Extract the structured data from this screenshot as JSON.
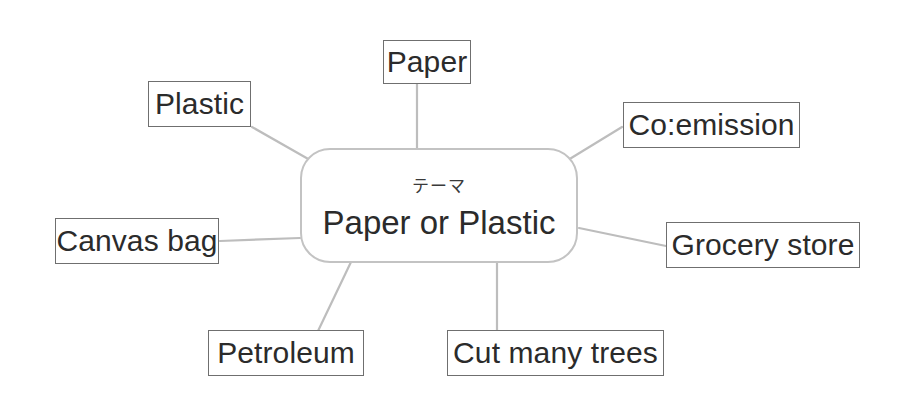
{
  "diagram": {
    "type": "mind-map",
    "background_color": "#ffffff",
    "connector_color": "#bdbdbd",
    "box_border_color": "#6f6f6f",
    "center_border_color": "#c3c3c3",
    "text_color": "#2b2b2b",
    "center": {
      "subtitle": "テーマ",
      "title": "Paper or Plastic"
    },
    "branches": [
      {
        "id": "paper",
        "label": "Paper",
        "position": "top"
      },
      {
        "id": "plastic",
        "label": "Plastic",
        "position": "top-left"
      },
      {
        "id": "co-emission",
        "label": "Co:emission",
        "position": "top-right"
      },
      {
        "id": "canvas-bag",
        "label": "Canvas bag",
        "position": "left"
      },
      {
        "id": "grocery-store",
        "label": "Grocery store",
        "position": "right"
      },
      {
        "id": "petroleum",
        "label": "Petroleum",
        "position": "bottom-left"
      },
      {
        "id": "cut-many-trees",
        "label": "Cut many trees",
        "position": "bottom"
      }
    ]
  }
}
